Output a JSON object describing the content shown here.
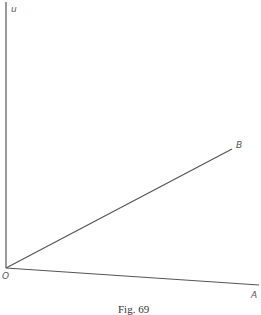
{
  "figure": {
    "caption": "Fig. 69",
    "labels": {
      "u": "u",
      "origin": "O",
      "B": "B",
      "A": "A"
    },
    "lines": {
      "vertical_axis": {
        "x1": 6,
        "y1": 2,
        "x2": 6,
        "y2": 268
      },
      "OB": {
        "x1": 6,
        "y1": 268,
        "x2": 232,
        "y2": 149
      },
      "OA": {
        "x1": 6,
        "y1": 268,
        "x2": 259,
        "y2": 285
      }
    },
    "stroke_color": "#555555"
  }
}
